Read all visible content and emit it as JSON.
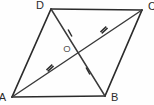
{
  "figure": {
    "name": "parallelogram-with-diagonals",
    "background_color": "#fefefe",
    "stroke_color": "#2b2b2b",
    "diagonal_color": "#3a3a3a",
    "width": 154,
    "height": 105
  },
  "vertices": [
    {
      "id": "D",
      "label": "D",
      "x": 51,
      "y": 9,
      "label_x": 44,
      "label_y": 9
    },
    {
      "id": "C",
      "label": "C",
      "x": 142,
      "y": 10,
      "label_x": 148,
      "label_y": 10
    },
    {
      "id": "B",
      "label": "B",
      "x": 105,
      "y": 96,
      "label_x": 111,
      "label_y": 101
    },
    {
      "id": "A",
      "label": "A",
      "x": 12,
      "y": 97,
      "label_x": 6,
      "label_y": 101
    }
  ],
  "center": {
    "id": "O",
    "label": "O",
    "x": 77,
    "y": 53,
    "label_x": 67,
    "label_y": 52
  },
  "edges": [
    {
      "name": "edge-DC",
      "from": "D",
      "to": "C"
    },
    {
      "name": "edge-CB",
      "from": "C",
      "to": "B"
    },
    {
      "name": "edge-BA",
      "from": "B",
      "to": "A"
    },
    {
      "name": "edge-AD",
      "from": "A",
      "to": "D"
    }
  ],
  "diagonals": [
    {
      "name": "diagonal-AC",
      "from": "A",
      "to": "C",
      "tick_count": 2
    },
    {
      "name": "diagonal-DB",
      "from": "D",
      "to": "B",
      "tick_count": 1
    }
  ],
  "tick_marks": [
    {
      "name": "tick-AO-double",
      "segment": "AO",
      "x": 50,
      "y": 68,
      "count": 2,
      "angle": -42.7
    },
    {
      "name": "tick-OC-double",
      "segment": "OC",
      "x": 104,
      "y": 30,
      "count": 2,
      "angle": -42.7
    },
    {
      "name": "tick-DO-single",
      "segment": "DO",
      "x": 70,
      "y": 33,
      "count": 1,
      "angle": 61.1
    },
    {
      "name": "tick-OB-single",
      "segment": "OB",
      "x": 88,
      "y": 71,
      "count": 1,
      "angle": 61.1
    }
  ]
}
